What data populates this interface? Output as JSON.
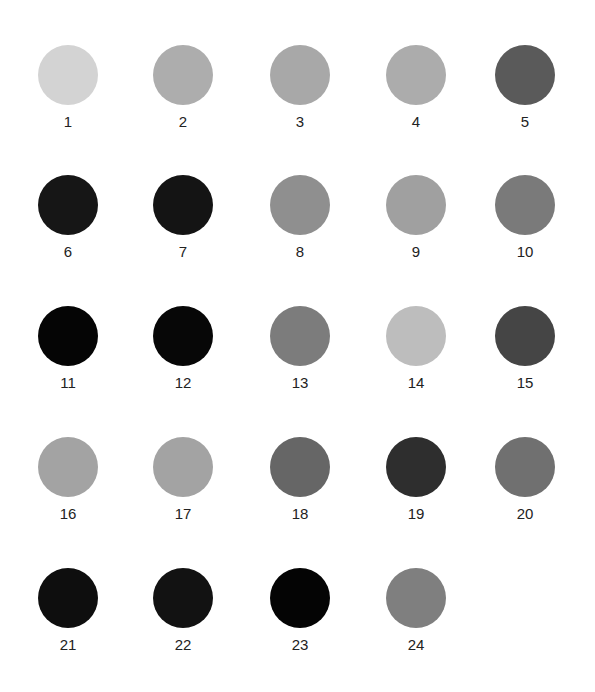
{
  "swatches": [
    {
      "label": "1",
      "color": "#d3d3d3"
    },
    {
      "label": "2",
      "color": "#adadad"
    },
    {
      "label": "3",
      "color": "#a8a8a8"
    },
    {
      "label": "4",
      "color": "#acacac"
    },
    {
      "label": "5",
      "color": "#5a5a5a"
    },
    {
      "label": "6",
      "color": "#161616"
    },
    {
      "label": "7",
      "color": "#141414"
    },
    {
      "label": "8",
      "color": "#8f8f8f"
    },
    {
      "label": "9",
      "color": "#a0a0a0"
    },
    {
      "label": "10",
      "color": "#7a7a7a"
    },
    {
      "label": "11",
      "color": "#050505"
    },
    {
      "label": "12",
      "color": "#070707"
    },
    {
      "label": "13",
      "color": "#7c7c7c"
    },
    {
      "label": "14",
      "color": "#bdbdbd"
    },
    {
      "label": "15",
      "color": "#454545"
    },
    {
      "label": "16",
      "color": "#a3a3a3"
    },
    {
      "label": "17",
      "color": "#a3a3a3"
    },
    {
      "label": "18",
      "color": "#666666"
    },
    {
      "label": "19",
      "color": "#2e2e2e"
    },
    {
      "label": "20",
      "color": "#707070"
    },
    {
      "label": "21",
      "color": "#0e0e0e"
    },
    {
      "label": "22",
      "color": "#121212"
    },
    {
      "label": "23",
      "color": "#040404"
    },
    {
      "label": "24",
      "color": "#7f7f7f"
    }
  ]
}
